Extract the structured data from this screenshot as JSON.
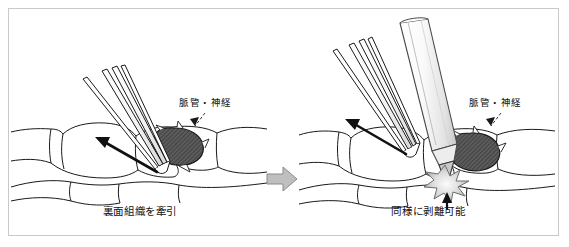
{
  "figure": {
    "domain_note": "surgical-technique-illustration",
    "background_color": "#ffffff",
    "frame_color": "#c9c9c9"
  },
  "transition": {
    "arrow_icon": "right-arrow-icon",
    "fill_color": "#bfbfbf",
    "stroke_color": "#8a8a8a"
  },
  "panels": [
    {
      "id": "left",
      "caption": "裏面組織を牽引",
      "vessel_label": "脈管・神経",
      "vessel_label_icon": "leader-line-arrow-icon",
      "instruments": [
        {
          "name": "forceps",
          "label": "鑷子",
          "stroke_color": "#1a1a1a"
        }
      ],
      "traction_arrow": {
        "name": "traction-arrow",
        "direction": "upper-left",
        "color": "#111111"
      },
      "vessel_bundle": {
        "name": "vessel-nerve-bundle",
        "fill_color": "#595959",
        "stroke_color": "#1a1a1a",
        "pattern": "hatched"
      },
      "tissue": {
        "name": "loose-connective-tissue",
        "stroke_color": "#1a1a1a",
        "fill_color": "#ffffff"
      }
    },
    {
      "id": "right",
      "caption": "同様に剥離可能",
      "vessel_label": "脈管・神経",
      "vessel_label_icon": "leader-line-arrow-icon",
      "instruments": [
        {
          "name": "forceps",
          "label": "鑷子",
          "stroke_color": "#1a1a1a"
        },
        {
          "name": "electrocautery-pen",
          "label": "電気メス",
          "stroke_color": "#4a4a4a",
          "fill_color": "#f2f2f2"
        }
      ],
      "traction_arrow": {
        "name": "traction-arrow",
        "direction": "upper-left",
        "color": "#111111"
      },
      "spark": {
        "name": "spark-burst-icon",
        "fill_color": "#d4d4d4",
        "stroke_color": "#6e6e6e"
      },
      "contact_arrow": {
        "name": "contact-point-arrow",
        "color": "#111111"
      },
      "vessel_bundle": {
        "name": "vessel-nerve-bundle",
        "fill_color": "#595959",
        "stroke_color": "#1a1a1a",
        "pattern": "hatched"
      },
      "tissue": {
        "name": "loose-connective-tissue",
        "stroke_color": "#1a1a1a",
        "fill_color": "#ffffff"
      }
    }
  ]
}
